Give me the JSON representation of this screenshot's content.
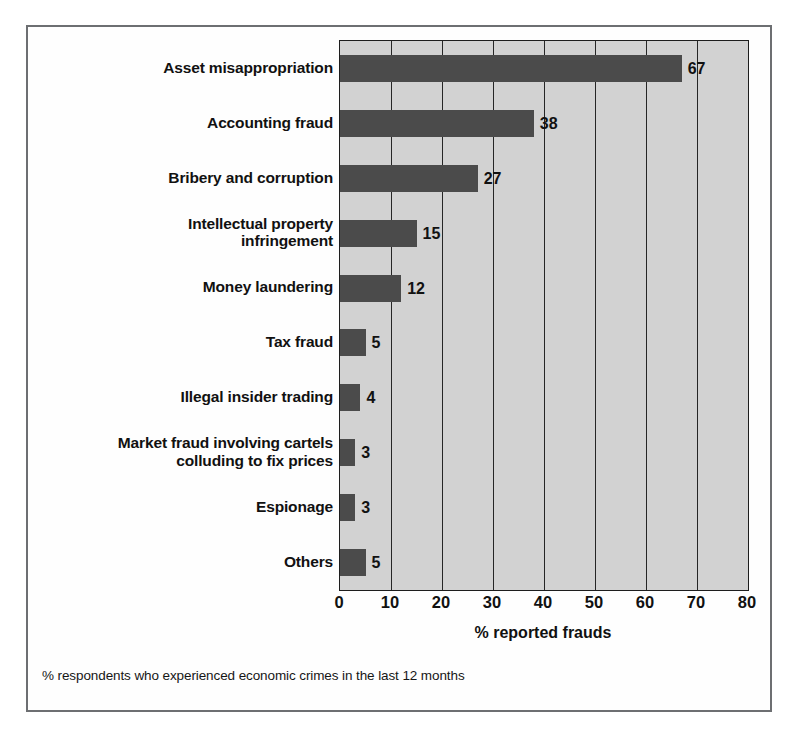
{
  "chart_data": {
    "type": "bar",
    "orientation": "horizontal",
    "title": "",
    "subtitle": "",
    "xlabel": "% reported frauds",
    "ylabel": "",
    "xlim": [
      0,
      80
    ],
    "xticks": [
      "0",
      "10",
      "20",
      "30",
      "40",
      "50",
      "60",
      "70",
      "80"
    ],
    "xtick_values": [
      0,
      10,
      20,
      30,
      40,
      50,
      60,
      70,
      80
    ],
    "grid": "vertical",
    "legend": "none",
    "categories": [
      "Asset misappropriation",
      "Accounting fraud",
      "Bribery and corruption",
      "Intellectual property\ninfringement",
      "Money laundering",
      "Tax fraud",
      "Illegal insider trading",
      "Market fraud involving cartels\ncolluding to fix prices",
      "Espionage",
      "Others"
    ],
    "values": [
      67,
      38,
      27,
      15,
      12,
      5,
      4,
      3,
      3,
      5
    ],
    "value_labels": [
      "67",
      "38",
      "27",
      "15",
      "12",
      "5",
      "4",
      "3",
      "3",
      "5"
    ],
    "annotation": "% respondents who experienced economic crimes in the last 12 months",
    "colors": {
      "bar": "#4b4b4b",
      "plot_background": "#d2d2d2",
      "gridline": "#262626",
      "axis": "#1d1d1d",
      "text": "#111111",
      "frame": "#6d6f72",
      "page_background": "#ffffff"
    }
  }
}
